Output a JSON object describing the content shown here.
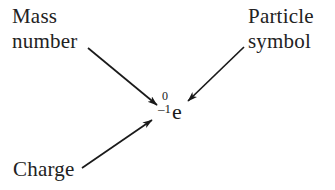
{
  "figure": {
    "background_color": "#ffffff",
    "ink_color": "#222222"
  },
  "notation": {
    "mass_number": "0",
    "charge": "–1",
    "element_symbol": "e",
    "full_text": "0 -1 e"
  },
  "labels": {
    "mass_number": {
      "line1": "Mass",
      "line2": "number"
    },
    "particle_symbol": {
      "line1": "Particle",
      "line2": "symbol"
    },
    "charge": {
      "line1": "Charge"
    }
  },
  "arrows": [
    {
      "name": "arrow-mass-number",
      "from_label": "Mass number",
      "points_to": "mass-number-superscript",
      "x1": 88,
      "y1": 48,
      "x2": 157,
      "y2": 105,
      "color": "#1a1a1a"
    },
    {
      "name": "arrow-particle-symbol",
      "from_label": "Particle symbol",
      "points_to": "element-symbol",
      "x1": 244,
      "y1": 47,
      "x2": 188,
      "y2": 101,
      "color": "#1a1a1a"
    },
    {
      "name": "arrow-charge",
      "from_label": "Charge",
      "points_to": "charge-subscript",
      "x1": 82,
      "y1": 168,
      "x2": 152,
      "y2": 120,
      "color": "#1a1a1a"
    }
  ]
}
